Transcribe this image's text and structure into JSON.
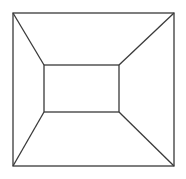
{
  "diagram": {
    "stroke_color": "#3a3a3a",
    "background_color": "#ffffff",
    "elements": [
      "outer-square",
      "inner-rectangle",
      "diagonal-top-left",
      "diagonal-top-right",
      "diagonal-bottom-left",
      "diagonal-bottom-right"
    ]
  }
}
